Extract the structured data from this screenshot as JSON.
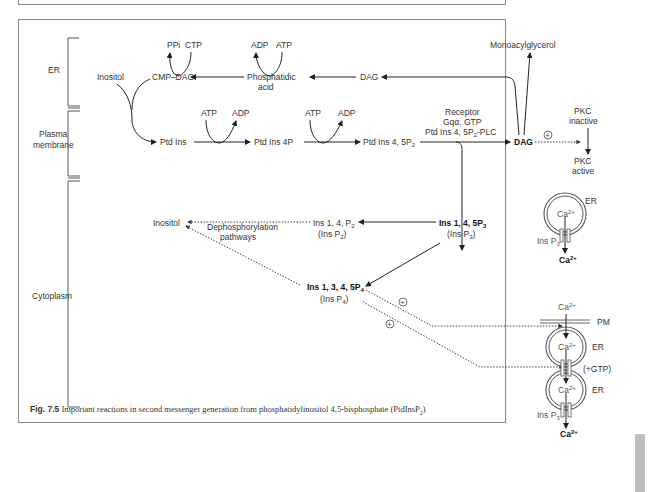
{
  "regions": {
    "er": "ER",
    "plasma_membrane_1": "Plasma",
    "plasma_membrane_2": "membrane",
    "cytoplasm": "Cytoplasm"
  },
  "er_row": {
    "ppi": "PPi",
    "ctp": "CTP",
    "adp": "ADP",
    "atp": "ATP",
    "inositol": "Inositol",
    "cmp_dag": "CMP–DAG",
    "phosphatidic_acid_1": "Phosphatidic",
    "phosphatidic_acid_2": "acid",
    "dag": "DAG",
    "monoacylglycerol": "Monoacylglycerol"
  },
  "pm_row": {
    "atp1": "ATP",
    "adp1": "ADP",
    "atp2": "ATP",
    "adp2": "ADP",
    "ptd_ins": "Ptd Ins",
    "ptd_ins_4p": "Ptd Ins 4P",
    "ptd_ins_45p2": "Ptd Ins 4, 5P",
    "ptd_ins_45p2_sub": "2",
    "receptor": "Receptor",
    "gq_gtp": "Gqα. GTP",
    "plc": "Ptd Ins 4, 5P",
    "plc_sub": "2",
    "plc_suffix": "-PLC",
    "dag": "DAG",
    "plus": "+",
    "pkc_inactive_1": "PKC",
    "pkc_inactive_2": "inactive",
    "pkc_active_1": "PKC",
    "pkc_active_2": "active"
  },
  "cyto": {
    "inositol": "Inositol",
    "deph_1": "Dephosphorylation",
    "deph_2": "pathways",
    "insp2_name": "Ins 1, 4, P",
    "insp2_sub": "2",
    "insp2_short": "(Ins P",
    "insp2_short_sub": "2",
    "insp3_name": "Ins 1, 4, 5P",
    "insp3_sub": "3",
    "insp3_short": "(Ins P",
    "insp3_short_sub": "3",
    "insp4_name": "Ins 1, 3, 4, 5P",
    "insp4_sub": "4",
    "insp4_short": "(Ins P",
    "insp4_short_sub": "4",
    "close_paren": ")",
    "plus": "+"
  },
  "ca_store_top": {
    "er": "ER",
    "ca": "Ca",
    "ca_sup": "2+",
    "insp3": "Ins P",
    "insp3_sub": "3",
    "ca_out": "Ca",
    "ca_out_sup": "2+"
  },
  "ca_store_bottom": {
    "ca_in": "Ca",
    "ca_in_sup": "2+",
    "pm": "PM",
    "ca1": "Ca",
    "ca1_sup": "2+",
    "er1": "ER",
    "gtp": "(+GTP)",
    "ca2": "Ca",
    "ca2_sup": "2+",
    "er2": "ER",
    "insp3": "Ins P",
    "insp3_sub": "3",
    "ca_out": "Ca",
    "ca_out_sup": "2+"
  },
  "caption": {
    "fig": "Fig. 7.5",
    "text": " Important reactions in second messenger generation from phosphatidylinositol 4,5-bisphosphate (PtdInsP",
    "sub": "2",
    "end": ")"
  }
}
